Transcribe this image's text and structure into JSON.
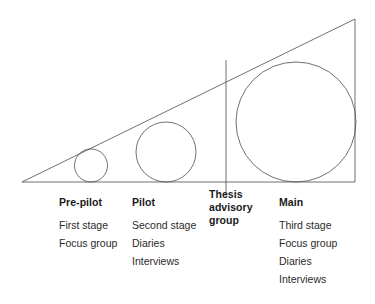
{
  "figure": {
    "stroke_color": "#4d4d4d",
    "stroke_width": 0.8,
    "background": "#ffffff",
    "triangle": {
      "name": "growth-triangle",
      "left_apex": {
        "x": 22,
        "y": 182
      },
      "top_right_apex": {
        "x": 355,
        "y": 19
      },
      "bottom_right": {
        "x": 355,
        "y": 182
      }
    },
    "divider_line": {
      "name": "thesis-advisory-group-divider",
      "x": 226,
      "y_top": 60,
      "y_bottom": 198
    },
    "circles": [
      {
        "name": "pre-pilot-circle",
        "cx": 91,
        "cy": 165.5,
        "r": 16.5
      },
      {
        "name": "pilot-circle",
        "cx": 166,
        "cy": 152,
        "r": 30
      },
      {
        "name": "main-circle",
        "cx": 296,
        "cy": 122,
        "r": 60
      }
    ]
  },
  "legend": {
    "columns": [
      {
        "key": "pre_pilot",
        "heading": "Pre-pilot",
        "items": [
          "First stage",
          "Focus group"
        ]
      },
      {
        "key": "pilot",
        "heading": "Pilot",
        "items": [
          "Second stage",
          "Diaries",
          "Interviews"
        ]
      },
      {
        "key": "thesis_advisory_group",
        "heading": "Thesis advisory group",
        "items": []
      },
      {
        "key": "main",
        "heading": "Main",
        "items": [
          "Third stage",
          "Focus group",
          "Diaries",
          "Interviews"
        ]
      }
    ]
  }
}
